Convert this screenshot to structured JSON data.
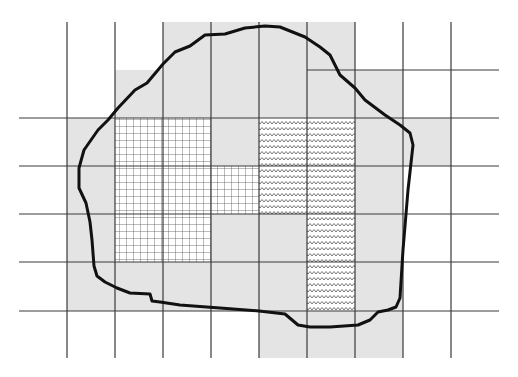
{
  "diagram": {
    "colors": {
      "background": "#ffffff",
      "partial_fill": "#e4e4e4",
      "grid_line": "#3a3a3a",
      "outline": "#111111",
      "hatch": "#444444"
    },
    "grid": {
      "cell_size": 48,
      "vertical_lines_x": [
        67,
        115,
        163,
        211,
        259,
        307,
        355,
        403,
        451
      ],
      "vertical_top_y": 22,
      "vertical_bottom_y": 358,
      "horizontal_lines": [
        {
          "y": 70,
          "x1": 307,
          "x2": 499
        },
        {
          "y": 118,
          "x1": 19,
          "x2": 499
        },
        {
          "y": 166,
          "x1": 19,
          "x2": 499
        },
        {
          "y": 214,
          "x1": 19,
          "x2": 499
        },
        {
          "y": 262,
          "x1": 19,
          "x2": 499
        },
        {
          "y": 311,
          "x1": 19,
          "x2": 499
        }
      ],
      "column_edges_x": [
        19,
        67,
        115,
        163,
        211,
        259,
        307,
        355,
        403,
        451,
        499
      ],
      "row_edges_y": [
        22,
        70,
        118,
        166,
        214,
        262,
        311,
        358
      ]
    },
    "cells": {
      "gray": [
        [
          0,
          3
        ],
        [
          0,
          4
        ],
        [
          0,
          5
        ],
        [
          0,
          6
        ],
        [
          1,
          2
        ],
        [
          1,
          3
        ],
        [
          1,
          4
        ],
        [
          1,
          5
        ],
        [
          1,
          6
        ],
        [
          1,
          7
        ],
        [
          2,
          1
        ],
        [
          2,
          4
        ],
        [
          2,
          7
        ],
        [
          2,
          8
        ],
        [
          3,
          1
        ],
        [
          3,
          7
        ],
        [
          4,
          1
        ],
        [
          4,
          4
        ],
        [
          4,
          5
        ],
        [
          4,
          7
        ],
        [
          5,
          1
        ],
        [
          5,
          2
        ],
        [
          5,
          3
        ],
        [
          5,
          4
        ],
        [
          5,
          5
        ],
        [
          5,
          7
        ],
        [
          6,
          5
        ],
        [
          6,
          6
        ],
        [
          6,
          7
        ]
      ],
      "grid_hatch": [
        [
          2,
          2
        ],
        [
          2,
          3
        ],
        [
          3,
          2
        ],
        [
          3,
          3
        ],
        [
          3,
          4
        ],
        [
          4,
          2
        ],
        [
          4,
          3
        ]
      ],
      "zigzag_hatch": [
        [
          2,
          5
        ],
        [
          2,
          6
        ],
        [
          3,
          5
        ],
        [
          3,
          6
        ],
        [
          4,
          6
        ],
        [
          5,
          6
        ]
      ]
    },
    "outline_points": [
      [
        79,
        168
      ],
      [
        84,
        150
      ],
      [
        98,
        130
      ],
      [
        108,
        120
      ],
      [
        118,
        108
      ],
      [
        135,
        90
      ],
      [
        147,
        83
      ],
      [
        163,
        64
      ],
      [
        175,
        52
      ],
      [
        190,
        46
      ],
      [
        205,
        35
      ],
      [
        225,
        34
      ],
      [
        245,
        28
      ],
      [
        265,
        26
      ],
      [
        280,
        27
      ],
      [
        305,
        37
      ],
      [
        320,
        47
      ],
      [
        330,
        55
      ],
      [
        340,
        75
      ],
      [
        355,
        88
      ],
      [
        365,
        100
      ],
      [
        385,
        115
      ],
      [
        400,
        125
      ],
      [
        410,
        133
      ],
      [
        413,
        145
      ],
      [
        408,
        190
      ],
      [
        403,
        250
      ],
      [
        400,
        298
      ],
      [
        396,
        307
      ],
      [
        388,
        310
      ],
      [
        378,
        312
      ],
      [
        370,
        320
      ],
      [
        358,
        325
      ],
      [
        330,
        327
      ],
      [
        310,
        327
      ],
      [
        298,
        325
      ],
      [
        285,
        314
      ],
      [
        259,
        311
      ],
      [
        220,
        308
      ],
      [
        180,
        305
      ],
      [
        160,
        302
      ],
      [
        152,
        301
      ],
      [
        150,
        294
      ],
      [
        130,
        293
      ],
      [
        117,
        288
      ],
      [
        105,
        282
      ],
      [
        97,
        276
      ],
      [
        94,
        266
      ],
      [
        92,
        240
      ],
      [
        90,
        222
      ],
      [
        86,
        203
      ],
      [
        79,
        188
      ],
      [
        79,
        168
      ]
    ]
  }
}
